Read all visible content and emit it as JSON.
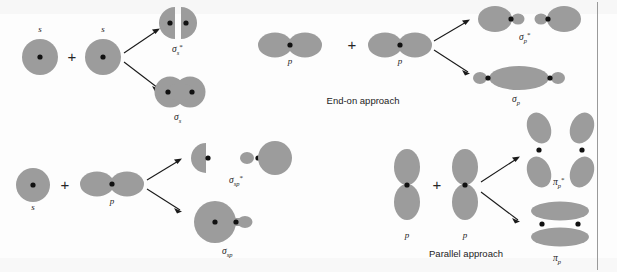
{
  "figure": {
    "background_color": "#fdfdfd",
    "orbital_color": "#9c9c9c",
    "nucleus_color": "#111111",
    "divider_color": "#9a9a9a",
    "plus_symbol": "+"
  },
  "panels": [
    {
      "id": "s-plus-s",
      "name": "s + s combination",
      "inputs": [
        {
          "label": "s",
          "type": "s-orbital"
        },
        {
          "label": "s",
          "type": "s-orbital"
        }
      ],
      "operator": "+",
      "outputs": [
        {
          "label_base": "σ",
          "label_sub": "s",
          "label_star": "*",
          "type": "antibonding",
          "full": "σ*s"
        },
        {
          "label_base": "σ",
          "label_sub": "s",
          "label_star": "",
          "type": "bonding",
          "full": "σs"
        }
      ],
      "caption": ""
    },
    {
      "id": "p-plus-p-end-on",
      "name": "p + p end-on combination",
      "inputs": [
        {
          "label": "p",
          "type": "p-orbital-horizontal"
        },
        {
          "label": "p",
          "type": "p-orbital-horizontal"
        }
      ],
      "operator": "+",
      "outputs": [
        {
          "label_base": "σ",
          "label_sub": "p",
          "label_star": "*",
          "type": "antibonding",
          "full": "σ*p"
        },
        {
          "label_base": "σ",
          "label_sub": "p",
          "label_star": "",
          "type": "bonding",
          "full": "σp"
        }
      ],
      "caption": "End-on approach"
    },
    {
      "id": "s-plus-p",
      "name": "s + p combination",
      "inputs": [
        {
          "label": "s",
          "type": "s-orbital"
        },
        {
          "label": "p",
          "type": "p-orbital-horizontal"
        }
      ],
      "operator": "+",
      "outputs": [
        {
          "label_base": "σ",
          "label_sub": "sp",
          "label_star": "*",
          "type": "antibonding",
          "full": "σ*sp"
        },
        {
          "label_base": "σ",
          "label_sub": "sp",
          "label_star": "",
          "type": "bonding",
          "full": "σsp"
        }
      ],
      "caption": ""
    },
    {
      "id": "p-plus-p-parallel",
      "name": "p + p parallel combination",
      "inputs": [
        {
          "label": "p",
          "type": "p-orbital-vertical"
        },
        {
          "label": "p",
          "type": "p-orbital-vertical"
        }
      ],
      "operator": "+",
      "outputs": [
        {
          "label_base": "π",
          "label_sub": "p",
          "label_star": "*",
          "type": "antibonding",
          "full": "π*p"
        },
        {
          "label_base": "π",
          "label_sub": "p",
          "label_star": "",
          "type": "bonding",
          "full": "πp"
        }
      ],
      "caption": "Parallel approach"
    }
  ]
}
